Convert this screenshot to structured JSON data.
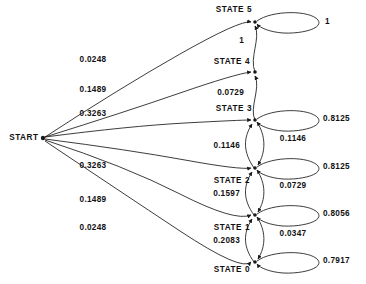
{
  "diagram": {
    "type": "markov-state-transition-diagram",
    "start_node": {
      "label": "START",
      "x": 43,
      "y": 138
    },
    "states": [
      {
        "id": "state5",
        "label": "STATE 5",
        "x": 255,
        "y": 22,
        "label_pos": "above-left",
        "self_loop": "1"
      },
      {
        "id": "state4",
        "label": "STATE 4",
        "x": 255,
        "y": 72,
        "label_pos": "left",
        "self_loop": null
      },
      {
        "id": "state3",
        "label": "STATE 3",
        "x": 255,
        "y": 120,
        "label_pos": "above-left",
        "self_loop": "0.8125"
      },
      {
        "id": "state2",
        "label": "STATE 2",
        "x": 255,
        "y": 168,
        "label_pos": "below-left",
        "self_loop": "0.8125"
      },
      {
        "id": "state1",
        "label": "STATE 1",
        "x": 255,
        "y": 215,
        "label_pos": "below-left",
        "self_loop": "0.8056"
      },
      {
        "id": "state0",
        "label": "STATE 0",
        "x": 255,
        "y": 262,
        "label_pos": "left",
        "self_loop": "0.7917"
      }
    ],
    "start_transitions": [
      {
        "to": "state5",
        "prob": "0.0248",
        "label_x": 93,
        "label_y": 60
      },
      {
        "to": "state4",
        "prob": "0.1489",
        "label_x": 93,
        "label_y": 90
      },
      {
        "to": "state3",
        "prob": "0.3263",
        "label_x": 93,
        "label_y": 114
      },
      {
        "to": "state2",
        "prob": "0.3263",
        "label_x": 93,
        "label_y": 166
      },
      {
        "to": "state1",
        "prob": "0.1489",
        "label_x": 93,
        "label_y": 200
      },
      {
        "to": "state0",
        "prob": "0.0248",
        "label_x": 93,
        "label_y": 228
      }
    ],
    "up_transitions": [
      {
        "from": "state4",
        "to": "state5",
        "prob": "1",
        "label_x": 237,
        "label_y": 41
      },
      {
        "from": "state3",
        "to": "state4",
        "prob": "0.0729",
        "label_x": 237,
        "label_y": 93
      },
      {
        "from": "state2",
        "to": "state3",
        "prob": "0.1146",
        "label_x": 237,
        "label_y": 146
      },
      {
        "from": "state1",
        "to": "state2",
        "prob": "0.1597",
        "label_x": 237,
        "label_y": 194
      },
      {
        "from": "state0",
        "to": "state1",
        "prob": "0.2083",
        "label_x": 237,
        "label_y": 241
      }
    ],
    "down_transitions": [
      {
        "from": "state3",
        "to": "state2",
        "prob": "0.1146",
        "label_x": 292,
        "label_y": 139
      },
      {
        "from": "state2",
        "to": "state1",
        "prob": "0.0729",
        "label_x": 292,
        "label_y": 186
      },
      {
        "from": "state1",
        "to": "state0",
        "prob": "0.0347",
        "label_x": 292,
        "label_y": 234
      }
    ],
    "self_loop_labels": [
      {
        "state": "state5",
        "prob": "1",
        "label_x": 330,
        "label_y": 22
      },
      {
        "state": "state3",
        "prob": "0.8125",
        "label_x": 330,
        "label_y": 119
      },
      {
        "state": "state2",
        "prob": "0.8125",
        "label_x": 330,
        "label_y": 167
      },
      {
        "state": "state1",
        "prob": "0.8056",
        "label_x": 330,
        "label_y": 214
      },
      {
        "state": "state0",
        "prob": "0.7917",
        "label_x": 330,
        "label_y": 261
      }
    ],
    "colors": {
      "stroke": "#1a1a1a",
      "text": "#111111",
      "background": "#ffffff"
    }
  }
}
